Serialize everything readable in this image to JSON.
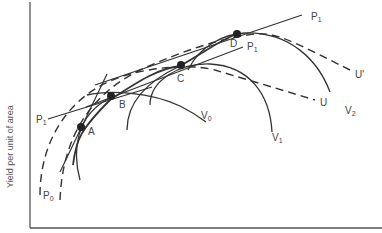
{
  "diagram": {
    "y_axis_label": "Yield per unit of area",
    "points": [
      {
        "id": "A",
        "label": "A"
      },
      {
        "id": "B",
        "label": "B"
      },
      {
        "id": "C",
        "label": "C"
      },
      {
        "id": "D",
        "label": "D"
      }
    ],
    "curves": {
      "V0": {
        "main": "V",
        "sub": "0"
      },
      "V1": {
        "main": "V",
        "sub": "1"
      },
      "V2": {
        "main": "V",
        "sub": "2"
      },
      "U": {
        "main": "U"
      },
      "U_prime": {
        "main": "U'"
      }
    },
    "price_lines": {
      "P0": {
        "main": "P",
        "sub": "0"
      },
      "P1_left": {
        "main": "P",
        "sub": "1"
      },
      "P1_mid": {
        "main": "P",
        "sub": "1"
      },
      "P1_top": {
        "main": "P",
        "sub": "1"
      }
    },
    "colors": {
      "line": "#333333",
      "axis": "#555555",
      "text": "#444444"
    }
  }
}
